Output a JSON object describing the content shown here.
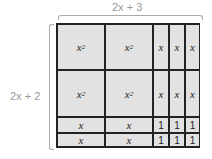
{
  "labels": {
    "top": "2x + 3",
    "left": "2x + 2"
  },
  "grid": {
    "columns": [
      "x",
      "x",
      "1",
      "1",
      "1"
    ],
    "rows": [
      [
        "x²",
        "x²",
        "x",
        "x",
        "x"
      ],
      [
        "x²",
        "x²",
        "x",
        "x",
        "x"
      ],
      [
        "x",
        "x",
        "1",
        "1",
        "1"
      ],
      [
        "x",
        "x",
        "1",
        "1",
        "1"
      ]
    ]
  }
}
